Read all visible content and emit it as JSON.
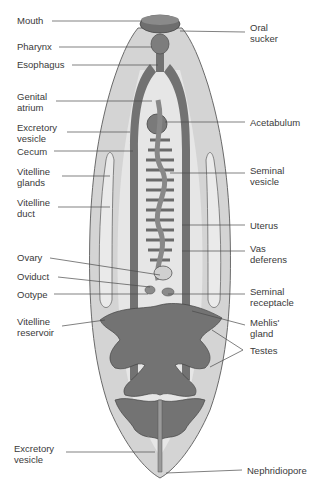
{
  "colors": {
    "body_fill": "#d4d4d4",
    "body_outline": "#6a6a6a",
    "organ_dark": "#727272",
    "organ_mid": "#9a9a9a",
    "organ_light": "#e6e6e6",
    "leader_line": "#4a4a4a",
    "label_text": "#3a3a3a"
  },
  "labels_left": [
    {
      "id": "mouth",
      "text": "Mouth",
      "x": 17,
      "y": 16
    },
    {
      "id": "pharynx",
      "text": "Pharynx",
      "x": 17,
      "y": 42
    },
    {
      "id": "esophagus",
      "text": "Esophagus",
      "x": 17,
      "y": 60
    },
    {
      "id": "genital-atrium",
      "text": "Genital\natrium",
      "x": 17,
      "y": 91
    },
    {
      "id": "excretory-vesicle-upper",
      "text": "Excretory\nvesicle",
      "x": 17,
      "y": 122
    },
    {
      "id": "cecum",
      "text": "Cecum",
      "x": 17,
      "y": 146
    },
    {
      "id": "vitelline-glands",
      "text": "Vitelline\nglands",
      "x": 17,
      "y": 167
    },
    {
      "id": "vitelline-duct",
      "text": "Vitelline\nduct",
      "x": 17,
      "y": 197
    },
    {
      "id": "ovary",
      "text": "Ovary",
      "x": 17,
      "y": 252
    },
    {
      "id": "oviduct",
      "text": "Oviduct",
      "x": 17,
      "y": 272
    },
    {
      "id": "ootype",
      "text": "Ootype",
      "x": 17,
      "y": 289
    },
    {
      "id": "vitelline-reservoir",
      "text": "Vitelline\nreservoir",
      "x": 17,
      "y": 316
    },
    {
      "id": "excretory-vesicle-lower",
      "text": "Excretory\nvesicle",
      "x": 14,
      "y": 443
    }
  ],
  "labels_right": [
    {
      "id": "oral-sucker",
      "text": "Oral\nsucker",
      "x": 250,
      "y": 22
    },
    {
      "id": "acetabulum",
      "text": "Acetabulum",
      "x": 250,
      "y": 118
    },
    {
      "id": "seminal-vesicle",
      "text": "Seminal\nvesicle",
      "x": 250,
      "y": 165
    },
    {
      "id": "uterus",
      "text": "Uterus",
      "x": 250,
      "y": 221
    },
    {
      "id": "vas-deferens",
      "text": "Vas\ndeferens",
      "x": 250,
      "y": 243
    },
    {
      "id": "seminal-receptacle",
      "text": "Seminal\nreceptacle",
      "x": 250,
      "y": 286
    },
    {
      "id": "mehlis-gland",
      "text": "Mehlis'\ngland",
      "x": 250,
      "y": 317
    },
    {
      "id": "testes",
      "text": "Testes",
      "x": 250,
      "y": 345
    },
    {
      "id": "nephridiopore",
      "text": "Nephridiopore",
      "x": 247,
      "y": 465
    }
  ]
}
